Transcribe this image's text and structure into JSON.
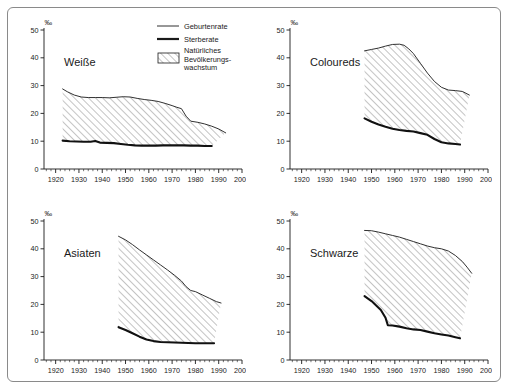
{
  "figure": {
    "unit_symbol": "‰",
    "axis": {
      "y_ticks": [
        "0",
        "10",
        "20",
        "30",
        "40",
        "50"
      ],
      "y_values": [
        0,
        10,
        20,
        30,
        40,
        50
      ],
      "x_ticks": [
        "1920",
        "1930",
        "1940",
        "1950",
        "1960",
        "1970",
        "1980",
        "1990",
        "2000"
      ],
      "x_values": [
        1920,
        1930,
        1940,
        1950,
        1960,
        1970,
        1980,
        1990,
        2000
      ],
      "xlim": [
        1915,
        2000
      ],
      "ylim": [
        0,
        50
      ]
    },
    "legend": {
      "items": [
        {
          "key": "geburtenrate",
          "label": "Geburtenrate",
          "style": "thin-line",
          "color": "#1a1a1a"
        },
        {
          "key": "sterberate",
          "label": "Sterberate",
          "style": "thick-line",
          "color": "#1a1a1a"
        },
        {
          "key": "wachstum",
          "label_line1": "Natürliches",
          "label_line2": "Bevölkerungs-",
          "label_line3": "wachstum",
          "style": "hatch-swatch",
          "color": "#555555"
        }
      ]
    }
  },
  "chart_data": [
    {
      "type": "area",
      "title": "Weiße",
      "xlabel": "",
      "ylabel": "‰",
      "xlim": [
        1915,
        2000
      ],
      "ylim": [
        0,
        50
      ],
      "grid": false,
      "legend_position": "top-right-figure",
      "series": [
        {
          "name": "Geburtenrate",
          "x": [
            1923,
            1925,
            1928,
            1931,
            1934,
            1937,
            1940,
            1943,
            1946,
            1949,
            1952,
            1955,
            1958,
            1961,
            1964,
            1967,
            1970,
            1972,
            1974,
            1976,
            1978,
            1981,
            1984,
            1987,
            1990,
            1993
          ],
          "values": [
            28.8,
            27.8,
            26.6,
            25.9,
            25.7,
            25.7,
            25.7,
            25.6,
            25.8,
            26.0,
            25.9,
            25.4,
            25.0,
            24.7,
            24.3,
            23.6,
            22.8,
            22.2,
            21.7,
            19.0,
            17.2,
            16.8,
            16.2,
            15.4,
            14.4,
            13.0
          ]
        },
        {
          "name": "Sterberate",
          "x": [
            1923,
            1926,
            1929,
            1932,
            1935,
            1937,
            1939,
            1942,
            1945,
            1948,
            1951,
            1954,
            1957,
            1960,
            1963,
            1966,
            1969,
            1972,
            1975,
            1978,
            1981,
            1984,
            1987
          ],
          "values": [
            10.2,
            10.0,
            9.9,
            9.8,
            9.8,
            10.1,
            9.5,
            9.4,
            9.3,
            9.0,
            8.7,
            8.5,
            8.4,
            8.4,
            8.4,
            8.5,
            8.5,
            8.5,
            8.5,
            8.4,
            8.4,
            8.3,
            8.3
          ]
        }
      ],
      "fill_between": {
        "from": "Sterberate",
        "to": "Geburtenrate",
        "label": "Natürliches Bevölkerungswachstum",
        "hatch": "///"
      }
    },
    {
      "type": "area",
      "title": "Coloureds",
      "xlabel": "",
      "ylabel": "‰",
      "xlim": [
        1915,
        2000
      ],
      "ylim": [
        0,
        50
      ],
      "grid": false,
      "series": [
        {
          "name": "Geburtenrate",
          "x": [
            1947,
            1950,
            1953,
            1956,
            1959,
            1962,
            1964,
            1966,
            1968,
            1971,
            1974,
            1977,
            1980,
            1983,
            1986,
            1989,
            1992
          ],
          "values": [
            42.5,
            43.0,
            43.5,
            44.2,
            44.8,
            44.9,
            44.5,
            43.2,
            41.5,
            38.0,
            34.5,
            31.5,
            29.4,
            28.4,
            28.2,
            27.9,
            26.6
          ]
        },
        {
          "name": "Sterberate",
          "x": [
            1947,
            1950,
            1953,
            1956,
            1959,
            1962,
            1965,
            1968,
            1971,
            1974,
            1977,
            1980,
            1983,
            1986,
            1988
          ],
          "values": [
            18.2,
            17.0,
            16.0,
            15.2,
            14.5,
            14.0,
            13.7,
            13.5,
            12.9,
            12.3,
            10.8,
            9.6,
            9.2,
            9.0,
            8.8
          ]
        }
      ],
      "fill_between": {
        "from": "Sterberate",
        "to": "Geburtenrate",
        "label": "Natürliches Bevölkerungswachstum",
        "hatch": "///"
      }
    },
    {
      "type": "area",
      "title": "Asiaten",
      "xlabel": "",
      "ylabel": "‰",
      "xlim": [
        1915,
        2000
      ],
      "ylim": [
        0,
        50
      ],
      "grid": false,
      "series": [
        {
          "name": "Geburtenrate",
          "x": [
            1947,
            1950,
            1953,
            1956,
            1959,
            1962,
            1965,
            1968,
            1971,
            1974,
            1976,
            1978,
            1980,
            1983,
            1986,
            1989,
            1991
          ],
          "values": [
            44.5,
            43.2,
            41.5,
            39.6,
            37.8,
            36.0,
            34.2,
            32.4,
            30.5,
            28.4,
            26.4,
            25.0,
            24.6,
            23.4,
            22.2,
            21.0,
            20.5
          ]
        },
        {
          "name": "Sterberate",
          "x": [
            1947,
            1950,
            1953,
            1956,
            1959,
            1962,
            1965,
            1968,
            1971,
            1974,
            1977,
            1980,
            1983,
            1986,
            1988
          ],
          "values": [
            11.8,
            10.8,
            9.6,
            8.4,
            7.4,
            6.8,
            6.5,
            6.4,
            6.3,
            6.2,
            6.1,
            6.0,
            6.0,
            6.0,
            6.0
          ]
        }
      ],
      "fill_between": {
        "from": "Sterberate",
        "to": "Geburtenrate",
        "label": "Natürliches Bevölkerungswachstum",
        "hatch": "///"
      }
    },
    {
      "type": "area",
      "title": "Schwarze",
      "xlabel": "",
      "ylabel": "‰",
      "xlim": [
        1915,
        2000
      ],
      "ylim": [
        0,
        50
      ],
      "grid": false,
      "series": [
        {
          "name": "Geburtenrate",
          "x": [
            1947,
            1950,
            1953,
            1956,
            1959,
            1962,
            1965,
            1968,
            1971,
            1974,
            1977,
            1980,
            1983,
            1986,
            1989,
            1991,
            1993
          ],
          "values": [
            46.6,
            46.5,
            46.0,
            45.4,
            44.8,
            44.2,
            43.4,
            42.6,
            41.8,
            41.0,
            40.4,
            40.0,
            39.2,
            37.6,
            35.4,
            33.4,
            31.2
          ]
        },
        {
          "name": "Sterberate",
          "x": [
            1947,
            1950,
            1952,
            1954,
            1956,
            1957,
            1959,
            1962,
            1965,
            1968,
            1971,
            1974,
            1977,
            1980,
            1983,
            1986,
            1988
          ],
          "values": [
            23.0,
            21.2,
            19.6,
            18.0,
            15.2,
            12.5,
            12.4,
            12.0,
            11.4,
            11.0,
            10.8,
            10.2,
            9.6,
            9.2,
            8.8,
            8.2,
            7.8
          ]
        }
      ],
      "fill_between": {
        "from": "Sterberate",
        "to": "Geburtenrate",
        "label": "Natürliches Bevölkerungswachstum",
        "hatch": "///"
      }
    }
  ]
}
